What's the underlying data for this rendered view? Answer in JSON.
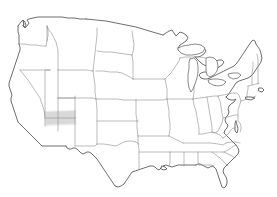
{
  "image": {
    "kind": "map",
    "title": "Outline map of the contiguous United States",
    "subject": "United States state boundary map with one highlighted region",
    "width": 277,
    "height": 197,
    "background_color": "#ffffff"
  },
  "map": {
    "projection_note": "Albers-like conic projection of the lower 48 states",
    "coastline_color": "#4a4a4a",
    "state_border_color": "#8d8d8d",
    "land_fill_color": "#ffffff",
    "lake_fill_color": "#ffffff",
    "labels_visible": false,
    "legend_visible": false,
    "title_visible": false
  },
  "highlight": {
    "name": "highlighted-state-region",
    "fill_color": "#c9c9c9",
    "opacity": 0.85,
    "approx_location": "northern Arizona / Nevada-Utah border area",
    "bbox": {
      "x": 45,
      "y": 111,
      "width": 30,
      "height": 13
    }
  },
  "features": {
    "great_lakes": [
      "Superior",
      "Michigan",
      "Huron",
      "Erie",
      "Ontario"
    ],
    "notable_shapes": [
      "Florida peninsula",
      "Texas",
      "Great Lakes",
      "Cape Cod",
      "Long Island",
      "Puget Sound"
    ]
  },
  "paths": {
    "coastline": "M 13 76 L 14 80 L 16 84 L 18 89 L 20 94 L 22 99 L 24 104 L 27 109 L 30 114 L 32 119 L 34 124 L 35 129 L 38 133 L 41 137 L 43 141 L 46 145 L 49 149 L 52 152 L 56 153 L 61 153 L 66 153 L 71 153 L 73 156 L 76 159 L 80 161 L 85 162 L 90 163 L 94 165 L 96 169 L 99 172 L 103 174 L 107 176 L 111 178 L 114 181 L 117 184 L 121 186 L 125 188 L 129 189 L 133 188 L 136 185 L 139 182 L 142 178 L 145 175 L 148 173 L 151 172 L 154 171 L 157 171 L 160 170 L 163 169 L 166 168 L 169 168 L 172 167 L 175 165 L 178 163 L 181 162 L 185 161 L 189 160 L 193 159 L 196 157 L 199 156 L 202 157 L 205 158 L 208 157 L 210 154 L 213 151 L 215 148 L 217 145 L 219 142 L 221 140 L 223 139 L 225 141 L 226 145 L 226 150 L 227 155 L 228 160 L 229 165 L 230 170 L 232 174 L 234 177 L 236 178 L 238 176 L 239 172 L 240 167 L 240 162 L 239 157 L 238 152 L 237 147 L 236 142 L 237 138 L 239 134 L 241 130 L 243 126 L 245 122 L 247 119 L 249 116 L 251 113 L 252 110 L 253 107 L 254 104 L 255 101 L 256 98 L 257 95 L 258 92 L 259 89 L 260 86 L 261 83 L 262 80 L 263 77 L 264 74 L 265 71 L 266 68 L 267 65 L 268 62 L 269 59 L 269 56 L 268 53 L 267 50 L 266 47 L 265 44 L 263 41 L 261 38 L 259 36 L 257 34 L 255 33 L 253 34 L 251 36 L 250 39 L 249 42 L 248 45 L 247 48 L 246 51 L 245 54 L 244 57 L 243 59 L 241 60 L 239 59 L 237 58 L 235 57 L 233 56 L 231 55 L 229 54 L 227 53 L 225 52 L 223 51 L 221 50 L 219 49 L 217 49 L 215 50 L 213 51 L 211 52 L 209 53 L 207 53 L 205 52 L 203 51 L 201 50 L 199 49 L 197 48 L 195 47 L 193 46 L 191 45 L 189 44 L 187 43 L 185 42 L 183 41 L 181 40 L 179 39 L 177 38 L 175 37 L 173 36 L 171 36 L 169 37 L 167 38 L 165 39 L 163 39 L 161 38 L 159 37 L 157 36 L 155 35 L 153 34 L 151 33 L 149 32 L 147 31 L 145 30 L 143 29 L 141 28 L 139 27 L 137 26 L 135 25 L 133 25 L 131 24 L 129 24 L 127 23 L 125 23 L 123 22 L 121 22 L 119 21 L 117 21 L 115 20 L 113 20 L 111 19 L 109 19 L 107 18 L 105 18 L 103 18 L 101 17 L 99 17 L 97 17 L 95 17 L 93 17 L 91 17 L 89 17 L 87 17 L 85 17 L 83 17 L 81 18 L 79 18 L 77 19 L 75 19 L 73 20 L 71 20 L 69 21 L 67 21 L 65 22 L 63 22 L 61 23 L 59 23 L 57 24 L 55 24 L 53 25 L 51 25 L 49 26 L 47 26 L 45 27 L 43 27 L 41 28 L 39 28 L 37 29 L 35 29 L 33 30 L 31 30 L 29 31 L 28 32 L 27 35 L 26 38 L 25 41 L 24 44 L 23 47 L 22 50 L 21 53 L 20 56 L 19 59 L 18 61 L 17 64 L 16 67 L 15 70 L 14 73 Z",
    "note": "Geometry is approximate vector tracing of the source bitmap"
  }
}
